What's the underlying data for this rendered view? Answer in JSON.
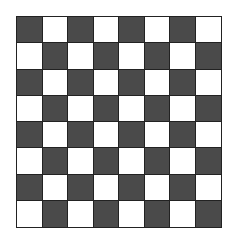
{
  "board": {
    "rows": 8,
    "cols": 8,
    "top_left": "dark",
    "colors": {
      "dark": "#4a4a4a",
      "light": "#ffffff",
      "grid_line": "#222222"
    },
    "pieces": []
  }
}
